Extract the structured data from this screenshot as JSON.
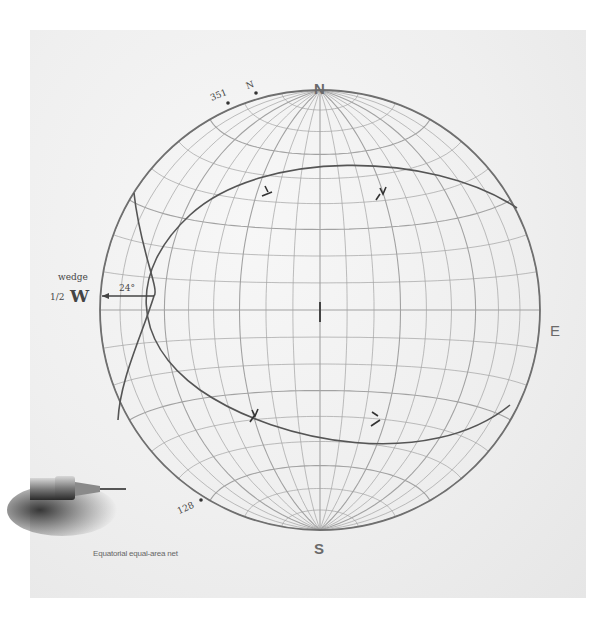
{
  "diagram": {
    "type": "stereonet",
    "caption": "Equatorial equal-area net",
    "center": [
      320,
      310
    ],
    "radius": 220,
    "colors": {
      "grid": "#9a9a9a",
      "primitive": "#6f6f6f",
      "great_circle": "#555555",
      "background": "#efefef"
    },
    "cardinals": {
      "north": "N",
      "south": "S",
      "east": "E",
      "west": "W"
    },
    "annotations": {
      "north_mark": "N",
      "azimuth_351": "351",
      "azimuth_128": "128",
      "wedge_label": "wedge",
      "half_prefix": "1/2",
      "angle_label": "24°"
    },
    "great_circles": [
      {
        "name": "plane-1",
        "description": "arc from upper-right primitive through left intersection to lower-right primitive"
      },
      {
        "name": "plane-2",
        "description": "arc near the western primitive, from upper-left to lower-left"
      }
    ],
    "intersection_point": [
      154,
      296
    ],
    "pole_marks": [
      {
        "label": "1",
        "x": 268,
        "y": 190
      },
      {
        "label": "2",
        "x": 382,
        "y": 193
      },
      {
        "label": "3",
        "x": 254,
        "y": 413
      },
      {
        "label": "4",
        "x": 375,
        "y": 415
      }
    ],
    "center_mark": [
      320,
      310
    ]
  }
}
